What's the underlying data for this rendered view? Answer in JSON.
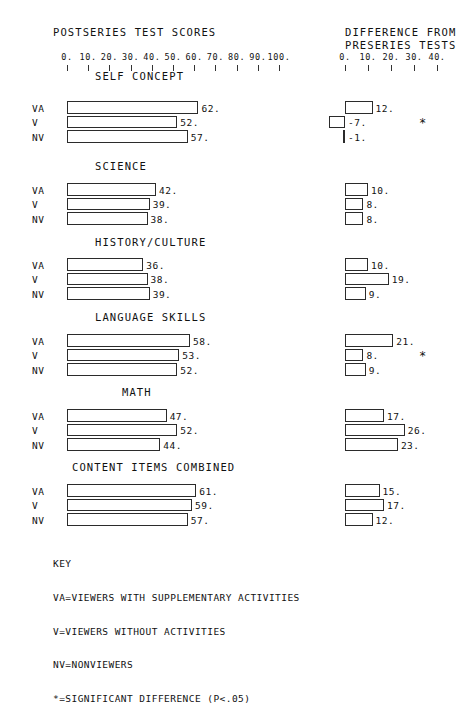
{
  "headers": {
    "left": "POSTSERIES TEST SCORES",
    "right_line1": "DIFFERENCE FROM",
    "right_line2": "PRESERIES TESTS"
  },
  "axes": {
    "left": {
      "labels": [
        "0.",
        "10.",
        "20.",
        "30.",
        "40.",
        "50.",
        "60.",
        "70.",
        "80.",
        "90.",
        "100."
      ],
      "min": 0,
      "max": 100
    },
    "right": {
      "labels": [
        "0.",
        "10.",
        "20.",
        "30.",
        "40."
      ],
      "min": 0,
      "max": 40
    }
  },
  "series_key": [
    "VA",
    "V",
    "NV"
  ],
  "sections": [
    {
      "title": "SELF CONCEPT",
      "rows": [
        {
          "label": "VA",
          "post": 62,
          "post_text": "62.",
          "diff": 12,
          "diff_text": "12.",
          "sig": false
        },
        {
          "label": "V",
          "post": 52,
          "post_text": "52.",
          "diff": -7,
          "diff_text": "-7.",
          "sig": true
        },
        {
          "label": "NV",
          "post": 57,
          "post_text": "57.",
          "diff": -1,
          "diff_text": "-1.",
          "sig": false
        }
      ]
    },
    {
      "title": "SCIENCE",
      "rows": [
        {
          "label": "VA",
          "post": 42,
          "post_text": "42.",
          "diff": 10,
          "diff_text": "10.",
          "sig": false
        },
        {
          "label": "V",
          "post": 39,
          "post_text": "39.",
          "diff": 8,
          "diff_text": "8.",
          "sig": false
        },
        {
          "label": "NV",
          "post": 38,
          "post_text": "38.",
          "diff": 8,
          "diff_text": "8.",
          "sig": false
        }
      ]
    },
    {
      "title": "HISTORY/CULTURE",
      "rows": [
        {
          "label": "VA",
          "post": 36,
          "post_text": "36.",
          "diff": 10,
          "diff_text": "10.",
          "sig": false
        },
        {
          "label": "V",
          "post": 38,
          "post_text": "38.",
          "diff": 19,
          "diff_text": "19.",
          "sig": false
        },
        {
          "label": "NV",
          "post": 39,
          "post_text": "39.",
          "diff": 9,
          "diff_text": "9.",
          "sig": false
        }
      ]
    },
    {
      "title": "LANGUAGE SKILLS",
      "rows": [
        {
          "label": "VA",
          "post": 58,
          "post_text": "58.",
          "diff": 21,
          "diff_text": "21.",
          "sig": false
        },
        {
          "label": "V",
          "post": 53,
          "post_text": "53.",
          "diff": 8,
          "diff_text": "8.",
          "sig": true
        },
        {
          "label": "NV",
          "post": 52,
          "post_text": "52.",
          "diff": 9,
          "diff_text": "9.",
          "sig": false
        }
      ]
    },
    {
      "title": "MATH",
      "rows": [
        {
          "label": "VA",
          "post": 47,
          "post_text": "47.",
          "diff": 17,
          "diff_text": "17.",
          "sig": false
        },
        {
          "label": "V",
          "post": 52,
          "post_text": "52.",
          "diff": 26,
          "diff_text": "26.",
          "sig": false
        },
        {
          "label": "NV",
          "post": 44,
          "post_text": "44.",
          "diff": 23,
          "diff_text": "23.",
          "sig": false
        }
      ]
    },
    {
      "title": "CONTENT ITEMS COMBINED",
      "rows": [
        {
          "label": "VA",
          "post": 61,
          "post_text": "61.",
          "diff": 15,
          "diff_text": "15.",
          "sig": false
        },
        {
          "label": "V",
          "post": 59,
          "post_text": "59.",
          "diff": 17,
          "diff_text": "17.",
          "sig": false
        },
        {
          "label": "NV",
          "post": 57,
          "post_text": "57.",
          "diff": 12,
          "diff_text": "12.",
          "sig": false
        }
      ]
    }
  ],
  "key": {
    "title": "KEY",
    "lines": [
      "VA=VIEWERS WITH SUPPLEMENTARY ACTIVITIES",
      "V=VIEWERS WITHOUT ACTIVITIES",
      "NV=NONVIEWERS",
      "*=SIGNIFICANT DIFFERENCE (P<.05)"
    ]
  },
  "chart_data": {
    "type": "bar",
    "orientation": "horizontal",
    "grid": false,
    "legend": "bottom",
    "panels": [
      {
        "name": "POSTSERIES TEST SCORES",
        "xlabel": "",
        "ylabel": "",
        "xlim": [
          0,
          100
        ],
        "xticks": [
          0,
          10,
          20,
          30,
          40,
          50,
          60,
          70,
          80,
          90,
          100
        ],
        "xticklabels": [
          "0.",
          "10.",
          "20.",
          "30.",
          "40.",
          "50.",
          "60.",
          "70.",
          "80.",
          "90.",
          "100."
        ],
        "categories": [
          "SELF CONCEPT",
          "SCIENCE",
          "HISTORY/CULTURE",
          "LANGUAGE SKILLS",
          "MATH",
          "CONTENT ITEMS COMBINED"
        ],
        "series": [
          {
            "name": "VA",
            "values": [
              62,
              42,
              36,
              58,
              47,
              61
            ]
          },
          {
            "name": "V",
            "values": [
              52,
              39,
              38,
              53,
              52,
              59
            ]
          },
          {
            "name": "NV",
            "values": [
              57,
              38,
              39,
              52,
              44,
              57
            ]
          }
        ]
      },
      {
        "name": "DIFFERENCE FROM PRESERIES TESTS",
        "xlabel": "",
        "ylabel": "",
        "xlim": [
          -10,
          40
        ],
        "xticks": [
          0,
          10,
          20,
          30,
          40
        ],
        "xticklabels": [
          "0.",
          "10.",
          "20.",
          "30.",
          "40."
        ],
        "categories": [
          "SELF CONCEPT",
          "SCIENCE",
          "HISTORY/CULTURE",
          "LANGUAGE SKILLS",
          "MATH",
          "CONTENT ITEMS COMBINED"
        ],
        "series": [
          {
            "name": "VA",
            "values": [
              12,
              10,
              10,
              21,
              17,
              15
            ]
          },
          {
            "name": "V",
            "values": [
              -7,
              8,
              19,
              8,
              26,
              17
            ]
          },
          {
            "name": "NV",
            "values": [
              -1,
              8,
              9,
              9,
              23,
              12
            ]
          }
        ],
        "significant": [
          {
            "category": "SELF CONCEPT",
            "series": "V"
          },
          {
            "category": "LANGUAGE SKILLS",
            "series": "V"
          }
        ]
      }
    ]
  }
}
